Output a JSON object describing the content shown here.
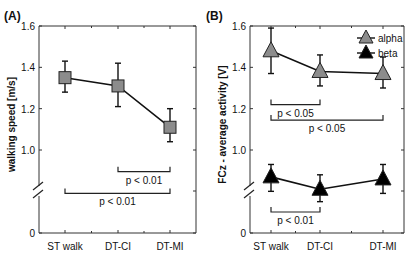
{
  "chart_data": [
    {
      "panel_label": "(A)",
      "type": "line",
      "title": "",
      "xlabel": "",
      "ylabel": "walking speed [m/s]",
      "categories": [
        "ST walk",
        "DT-CI",
        "DT-MI"
      ],
      "y_ticks": [
        "0",
        "1.0",
        "1.2",
        "1.4",
        "1.6"
      ],
      "ylim": [
        1.0,
        1.6
      ],
      "axis_break": true,
      "grid": false,
      "series": [
        {
          "name": "walking speed",
          "marker": "square",
          "color": "#8c8c8c",
          "values": [
            1.35,
            1.31,
            1.11
          ],
          "err_low": [
            1.28,
            1.21,
            1.04
          ],
          "err_high": [
            1.43,
            1.42,
            1.2
          ]
        }
      ],
      "annotations": [
        {
          "from": 1,
          "to": 2,
          "label": "p < 0.01",
          "y": 0.895
        },
        {
          "from": 0,
          "to": 2,
          "label": "p < 0.01",
          "y": 0.79
        }
      ]
    },
    {
      "panel_label": "(B)",
      "type": "line",
      "title": "",
      "xlabel": "",
      "ylabel": "FCz - average activity [V]",
      "categories": [
        "ST walk",
        "DT-CI",
        "DT-MI"
      ],
      "y_ticks": [
        "0",
        "1.0",
        "1.2",
        "1.4",
        "1.6"
      ],
      "ylim": [
        1.0,
        1.6
      ],
      "axis_break": true,
      "grid": false,
      "legend": {
        "position": "top-right",
        "entries": [
          "alpha",
          "beta"
        ]
      },
      "series": [
        {
          "name": "alpha",
          "marker": "triangle",
          "color": "#8c8c8c",
          "values": [
            1.48,
            1.38,
            1.37
          ],
          "err_low": [
            1.37,
            1.31,
            1.3
          ],
          "err_high": [
            1.59,
            1.46,
            1.45
          ]
        },
        {
          "name": "beta",
          "marker": "triangle",
          "color": "#000000",
          "values": [
            0.87,
            0.81,
            0.86
          ],
          "err_low": [
            0.8,
            0.75,
            0.79
          ],
          "err_high": [
            0.93,
            0.88,
            0.93
          ]
        }
      ],
      "annotations": [
        {
          "from": 0,
          "to": 1,
          "label": "p < 0.05",
          "y": 1.22
        },
        {
          "from": 0,
          "to": 2,
          "label": "p < 0.05",
          "y": 1.145
        },
        {
          "from": 0,
          "to": 1,
          "label": "p < 0.01",
          "y": 0.7
        }
      ]
    }
  ]
}
